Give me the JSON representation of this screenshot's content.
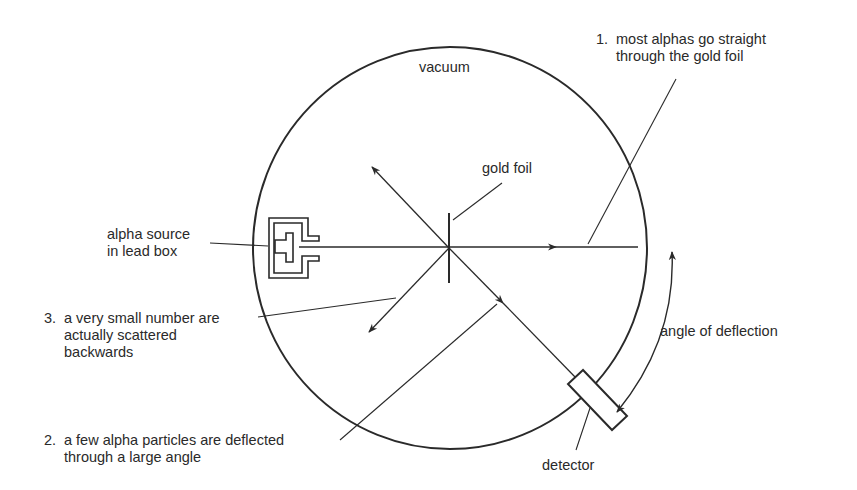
{
  "diagram": {
    "title_region": "vacuum",
    "labels": {
      "vacuum": "vacuum",
      "gold_foil": "gold foil",
      "alpha_source_line1": "alpha source",
      "alpha_source_line2": "in lead box",
      "angle_of_deflection": "angle of deflection",
      "detector": "detector"
    },
    "notes": [
      {
        "number": "1.",
        "line1": "most alphas go straight",
        "line2": "through the gold foil"
      },
      {
        "number": "2.",
        "line1": "a few alpha particles are deflected",
        "line2": "through a large angle"
      },
      {
        "number": "3.",
        "line1": "a very small number are",
        "line2": "actually scattered",
        "line3": "backwards"
      }
    ],
    "colors": {
      "stroke": "#2a2a2a",
      "background": "#ffffff"
    }
  }
}
